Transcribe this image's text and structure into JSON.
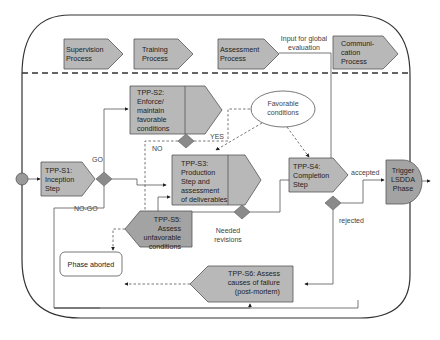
{
  "diagram": {
    "top_processes": [
      {
        "id": "supervision",
        "lines": [
          "Supervision",
          "Process"
        ]
      },
      {
        "id": "training",
        "lines": [
          "Training",
          "Process"
        ]
      },
      {
        "id": "assessment",
        "lines": [
          "Assessment",
          "Process"
        ]
      },
      {
        "id": "communication",
        "lines": [
          "Communi-",
          "cation",
          "Process"
        ]
      }
    ],
    "steps": {
      "s1": {
        "lines": [
          "TPP-S1:",
          "Inception",
          "Step"
        ]
      },
      "s2": {
        "lines": [
          "TPP-S2:",
          "Enforce/",
          "maintain",
          "favorable",
          "conditions"
        ]
      },
      "s3": {
        "lines": [
          "TPP-S3:",
          "Production",
          "Step and",
          "assessment",
          "of deliverables"
        ]
      },
      "s4": {
        "lines": [
          "TPP-S4:",
          "Completion",
          "Step"
        ]
      },
      "s5": {
        "lines": [
          "TPP-S5:",
          "Assess",
          "unfavorable",
          "conditions"
        ]
      },
      "s6": {
        "lines": [
          "TPP-S6: Assess",
          "causes of failure",
          "(post-mortem)"
        ]
      }
    },
    "favorable_conditions": {
      "lines": [
        "Favorable",
        "conditions"
      ]
    },
    "trigger": {
      "lines": [
        "Trigger",
        "LSDDA",
        "Phase"
      ]
    },
    "phase_aborted": "Phase aborted",
    "edge_labels": {
      "input_global": [
        "Input for global",
        "evaluation"
      ],
      "go": "GO",
      "no_go": "NO-GO",
      "yes": "YES",
      "no": "NO",
      "needed_revisions": [
        "Needed",
        "revisions"
      ],
      "accepted": "accepted",
      "rejected": "rejected"
    }
  }
}
